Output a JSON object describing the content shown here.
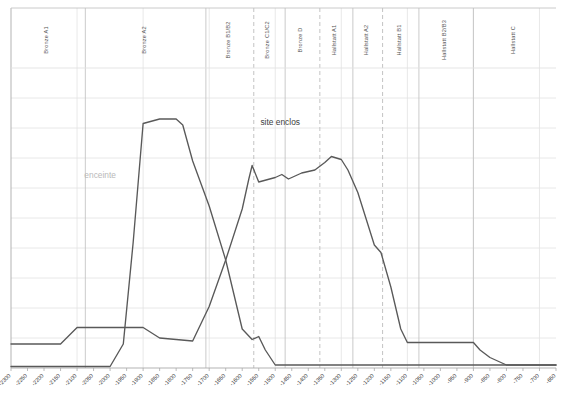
{
  "chart_data": {
    "type": "line",
    "title": "",
    "subtitle": "",
    "xlabel": "",
    "ylabel": "",
    "grid": true,
    "legend": "none",
    "xlim": [
      -2300,
      -650
    ],
    "ylim": [
      0,
      10
    ],
    "x_tick_labels": [
      "-2300",
      "-2250",
      "-2200",
      "-2150",
      "-2100",
      "-2050",
      "-2000",
      "-1950",
      "-1900",
      "-1850",
      "-1800",
      "-1750",
      "-1700",
      "-1650",
      "-1600",
      "-1550",
      "-1500",
      "-1450",
      "-1400",
      "-1350",
      "-1300",
      "-1250",
      "-1200",
      "-1150",
      "-1100",
      "-1050",
      "-1000",
      "-950",
      "-900",
      "-850",
      "-800",
      "-750",
      "-700",
      "-650"
    ],
    "x_tick_values": [
      -2300,
      -2250,
      -2200,
      -2150,
      -2100,
      -2050,
      -2000,
      -1950,
      -1900,
      -1850,
      -1800,
      -1750,
      -1700,
      -1650,
      -1600,
      -1550,
      -1500,
      -1450,
      -1400,
      -1350,
      -1300,
      -1250,
      -1200,
      -1150,
      -1100,
      -1050,
      -1000,
      -950,
      -900,
      -850,
      -800,
      -750,
      -700,
      -650
    ],
    "y_gridline_values": [
      1,
      2,
      3,
      4,
      5,
      6,
      7,
      8,
      9
    ],
    "series": [
      {
        "name": "enceinte",
        "color": "#595959",
        "x": [
          -2300,
          -2150,
          -2100,
          -2050,
          -1950,
          -1900,
          -1850,
          -1800,
          -1750,
          -1700,
          -1650,
          -1600,
          -1580,
          -1570,
          -1550,
          -1500,
          -1480,
          -1460,
          -1440,
          -1420,
          -1400,
          -1380,
          -1350,
          -1330,
          -1300,
          -1280,
          -1250,
          -1220,
          -1200,
          -1180,
          -1150,
          -1120,
          -1100,
          -1050,
          -1000,
          -950,
          -900,
          -880,
          -850,
          -800,
          -750,
          -700,
          -650
        ],
        "y": [
          0.8,
          0.8,
          1.35,
          1.35,
          1.35,
          1.35,
          1.0,
          0.95,
          0.9,
          2.05,
          3.6,
          5.3,
          6.3,
          6.75,
          6.2,
          6.35,
          6.45,
          6.3,
          6.4,
          6.5,
          6.55,
          6.6,
          6.85,
          7.05,
          6.95,
          6.6,
          5.85,
          4.8,
          4.1,
          3.85,
          2.7,
          1.3,
          0.85,
          0.85,
          0.85,
          0.85,
          0.85,
          0.6,
          0.35,
          0.1,
          0.1,
          0.1,
          0.1
        ]
      },
      {
        "name": "site enclos",
        "color": "#595959",
        "x": [
          -2300,
          -2000,
          -1960,
          -1930,
          -1900,
          -1850,
          -1800,
          -1780,
          -1750,
          -1700,
          -1650,
          -1600,
          -1570,
          -1550,
          -1530,
          -1500,
          -1450,
          -1400,
          -1300,
          -1200,
          -1100,
          -1000,
          -900,
          -800,
          -700,
          -650
        ],
        "y": [
          0.05,
          0.05,
          0.8,
          4.2,
          8.15,
          8.3,
          8.3,
          8.1,
          6.9,
          5.4,
          3.6,
          1.3,
          0.95,
          1.05,
          0.6,
          0.1,
          0.1,
          0.1,
          0.1,
          0.1,
          0.1,
          0.1,
          0.1,
          0.1,
          0.1,
          0.1
        ]
      }
    ],
    "annotations": [
      {
        "text": "enceinte",
        "x": -2030,
        "y": 6.35,
        "style": "light"
      },
      {
        "text": "site enclos",
        "x": -1485,
        "y": 8.1,
        "style": "dark"
      }
    ]
  },
  "periods": {
    "bands": [
      {
        "label": "Bronze A1",
        "start": -2300,
        "end": -2075,
        "divider": "solid"
      },
      {
        "label": "Bronze A2",
        "start": -2075,
        "end": -1710,
        "divider": "solid"
      },
      {
        "label": "Bronze B1/B2",
        "start": -1710,
        "end": -1565,
        "divider": "solid"
      },
      {
        "label": "Bronze C1/C2",
        "start": -1565,
        "end": -1470,
        "divider": "dashed"
      },
      {
        "label": "Bronze D",
        "start": -1470,
        "end": -1365,
        "divider": "solid"
      },
      {
        "label": "Hallstatt A1",
        "start": -1365,
        "end": -1265,
        "divider": "dashed"
      },
      {
        "label": "Hallstatt A2",
        "start": -1265,
        "end": -1175,
        "divider": "solid"
      },
      {
        "label": "Hallstatt B1",
        "start": -1175,
        "end": -1065,
        "divider": "dashed"
      },
      {
        "label": "Hallstatt B2/B3",
        "start": -1065,
        "end": -900,
        "divider": "solid"
      },
      {
        "label": "Hallstatt C",
        "start": -900,
        "end": -650,
        "divider": "solid"
      }
    ]
  },
  "colors": {
    "line": "#595959",
    "grid": "#e2e2e2",
    "axis": "#aaaaaa",
    "divider_solid": "#c4c4c4",
    "divider_dashed": "#bdbdbd",
    "label_period": "#555555",
    "label_tick": "#3a3a3a",
    "annotation_light": "#b9b9b9",
    "annotation_dark": "#3d3d3d",
    "background": "#ffffff"
  }
}
